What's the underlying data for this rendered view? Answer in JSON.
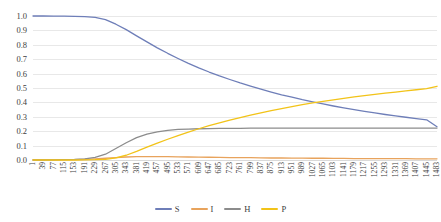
{
  "chart_data": {
    "type": "line",
    "title": "",
    "xlabel": "",
    "ylabel": "",
    "ylim": [
      0.0,
      1.0
    ],
    "xlim": [
      1,
      1483
    ],
    "grid": true,
    "legend_position": "bottom",
    "y_ticks": [
      "1.0",
      "0.9",
      "0.8",
      "0.7",
      "0.6",
      "0.5",
      "0.4",
      "0.3",
      "0.2",
      "0.1",
      "0.0"
    ],
    "x_ticks": [
      "1",
      "39",
      "77",
      "115",
      "153",
      "191",
      "229",
      "267",
      "305",
      "343",
      "381",
      "419",
      "457",
      "495",
      "533",
      "571",
      "609",
      "647",
      "685",
      "723",
      "761",
      "799",
      "837",
      "875",
      "913",
      "951",
      "989",
      "1027",
      "1065",
      "1103",
      "1141",
      "1179",
      "1217",
      "1255",
      "1293",
      "1331",
      "1369",
      "1407",
      "1445",
      "1483"
    ],
    "x": [
      1,
      39,
      77,
      115,
      153,
      191,
      229,
      267,
      305,
      343,
      381,
      419,
      457,
      495,
      533,
      571,
      609,
      647,
      685,
      723,
      761,
      799,
      837,
      875,
      913,
      951,
      989,
      1027,
      1065,
      1103,
      1141,
      1179,
      1217,
      1255,
      1293,
      1331,
      1369,
      1407,
      1445,
      1483
    ],
    "series": [
      {
        "name": "S",
        "color": "#6E7EB8",
        "values": [
          1.0,
          1.0,
          0.999,
          0.999,
          0.998,
          0.996,
          0.99,
          0.975,
          0.943,
          0.905,
          0.862,
          0.82,
          0.779,
          0.741,
          0.705,
          0.671,
          0.64,
          0.611,
          0.584,
          0.559,
          0.535,
          0.513,
          0.492,
          0.472,
          0.453,
          0.436,
          0.419,
          0.404,
          0.389,
          0.375,
          0.362,
          0.35,
          0.338,
          0.327,
          0.316,
          0.306,
          0.297,
          0.288,
          0.279,
          0.231
        ]
      },
      {
        "name": "I",
        "color": "#E8A35C",
        "values": [
          0.0,
          0.001,
          0.001,
          0.002,
          0.003,
          0.005,
          0.008,
          0.012,
          0.017,
          0.021,
          0.023,
          0.024,
          0.024,
          0.023,
          0.022,
          0.021,
          0.02,
          0.019,
          0.018,
          0.017,
          0.016,
          0.016,
          0.015,
          0.014,
          0.014,
          0.013,
          0.013,
          0.012,
          0.012,
          0.011,
          0.011,
          0.01,
          0.01,
          0.01,
          0.009,
          0.009,
          0.009,
          0.008,
          0.008,
          0.008
        ]
      },
      {
        "name": "H",
        "color": "#8C8C8C",
        "values": [
          0.0,
          0.0,
          0.001,
          0.002,
          0.004,
          0.008,
          0.018,
          0.04,
          0.08,
          0.12,
          0.155,
          0.18,
          0.196,
          0.206,
          0.212,
          0.215,
          0.217,
          0.218,
          0.219,
          0.22,
          0.22,
          0.221,
          0.221,
          0.221,
          0.221,
          0.221,
          0.222,
          0.222,
          0.222,
          0.222,
          0.222,
          0.222,
          0.222,
          0.222,
          0.222,
          0.222,
          0.222,
          0.222,
          0.222,
          0.222
        ]
      },
      {
        "name": "P",
        "color": "#F2C318",
        "values": [
          0.0,
          0.0,
          0.0,
          0.0,
          0.0,
          0.001,
          0.002,
          0.005,
          0.014,
          0.033,
          0.06,
          0.089,
          0.117,
          0.144,
          0.17,
          0.194,
          0.217,
          0.238,
          0.258,
          0.277,
          0.295,
          0.312,
          0.328,
          0.343,
          0.357,
          0.371,
          0.384,
          0.396,
          0.407,
          0.418,
          0.428,
          0.438,
          0.447,
          0.456,
          0.464,
          0.472,
          0.48,
          0.488,
          0.496,
          0.512
        ]
      }
    ]
  },
  "legend": {
    "items": [
      {
        "label": "S",
        "color": "#6E7EB8"
      },
      {
        "label": "I",
        "color": "#E8A35C"
      },
      {
        "label": "H",
        "color": "#8C8C8C"
      },
      {
        "label": "P",
        "color": "#F2C318"
      }
    ]
  }
}
